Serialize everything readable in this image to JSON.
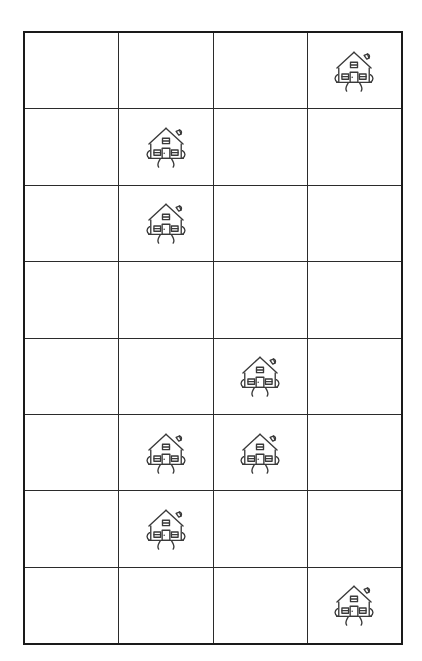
{
  "page": {
    "background_color": "#ffffff",
    "width": 422,
    "height": 661
  },
  "grid": {
    "columns": 4,
    "rows": 8,
    "border_color": "#1a1a1a",
    "line_color": "#2b2b2b",
    "outer_border_width_px": 2.5,
    "inner_line_width_px": 1.2,
    "cell_width_px": 93,
    "cell_height_px": 75,
    "icon_name": "house-icon",
    "icon_color": "#3a3a3a",
    "cells": [
      [
        {
          "row": 1,
          "col": 1,
          "content": "empty"
        },
        {
          "row": 1,
          "col": 2,
          "content": "empty"
        },
        {
          "row": 1,
          "col": 3,
          "content": "empty"
        },
        {
          "row": 1,
          "col": 4,
          "content": "house"
        }
      ],
      [
        {
          "row": 2,
          "col": 1,
          "content": "empty"
        },
        {
          "row": 2,
          "col": 2,
          "content": "house"
        },
        {
          "row": 2,
          "col": 3,
          "content": "empty"
        },
        {
          "row": 2,
          "col": 4,
          "content": "empty"
        }
      ],
      [
        {
          "row": 3,
          "col": 1,
          "content": "empty"
        },
        {
          "row": 3,
          "col": 2,
          "content": "house"
        },
        {
          "row": 3,
          "col": 3,
          "content": "empty"
        },
        {
          "row": 3,
          "col": 4,
          "content": "empty"
        }
      ],
      [
        {
          "row": 4,
          "col": 1,
          "content": "empty"
        },
        {
          "row": 4,
          "col": 2,
          "content": "empty"
        },
        {
          "row": 4,
          "col": 3,
          "content": "empty"
        },
        {
          "row": 4,
          "col": 4,
          "content": "empty"
        }
      ],
      [
        {
          "row": 5,
          "col": 1,
          "content": "empty"
        },
        {
          "row": 5,
          "col": 2,
          "content": "empty"
        },
        {
          "row": 5,
          "col": 3,
          "content": "house"
        },
        {
          "row": 5,
          "col": 4,
          "content": "empty"
        }
      ],
      [
        {
          "row": 6,
          "col": 1,
          "content": "empty"
        },
        {
          "row": 6,
          "col": 2,
          "content": "house"
        },
        {
          "row": 6,
          "col": 3,
          "content": "house"
        },
        {
          "row": 6,
          "col": 4,
          "content": "empty"
        }
      ],
      [
        {
          "row": 7,
          "col": 1,
          "content": "empty"
        },
        {
          "row": 7,
          "col": 2,
          "content": "house"
        },
        {
          "row": 7,
          "col": 3,
          "content": "empty"
        },
        {
          "row": 7,
          "col": 4,
          "content": "empty"
        }
      ],
      [
        {
          "row": 8,
          "col": 1,
          "content": "empty"
        },
        {
          "row": 8,
          "col": 2,
          "content": "empty"
        },
        {
          "row": 8,
          "col": 3,
          "content": "empty"
        },
        {
          "row": 8,
          "col": 4,
          "content": "house"
        }
      ]
    ],
    "house_count": 8
  }
}
